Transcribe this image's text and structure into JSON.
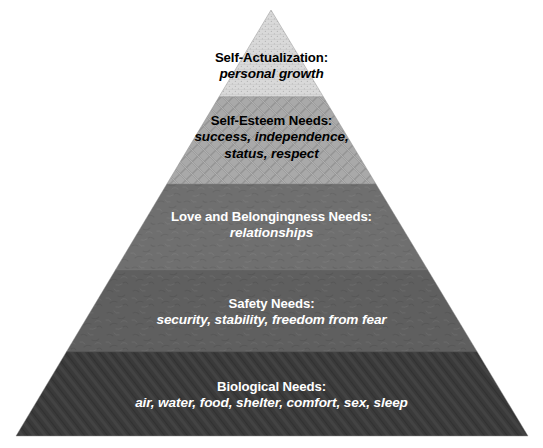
{
  "diagram": {
    "name": "Maslow's Hierarchy of Needs pyramid",
    "background_color": "#ffffff",
    "geometry": {
      "apex_x": 271,
      "apex_y": 10,
      "base_left_x": 16,
      "base_right_x": 528,
      "base_y": 436
    },
    "levels": [
      {
        "id": "self-actualization",
        "rank": 5,
        "title": "Self-Actualization:",
        "subtitle": "personal growth",
        "fill_color": "#d9d9d9",
        "text_color": "#000000",
        "texture": "fine-dotted-brick",
        "top_y": 10,
        "bottom_y": 97
      },
      {
        "id": "self-esteem",
        "rank": 4,
        "title": "Self-Esteem Needs:",
        "subtitle": "success, independence,\nstatus, respect",
        "subtitle_line_1": "success, independence,",
        "subtitle_line_2": "status, respect",
        "fill_color": "#a9a9a9",
        "text_color": "#000000",
        "texture": "diamond-lattice",
        "top_y": 97,
        "bottom_y": 184
      },
      {
        "id": "love-and-belongingness",
        "rank": 3,
        "title": "Love and Belongingness Needs:",
        "subtitle": "relationships",
        "fill_color": "#6f6f6f",
        "text_color": "#ffffff",
        "texture": "mottled-speckle",
        "top_y": 184,
        "bottom_y": 270
      },
      {
        "id": "safety",
        "rank": 2,
        "title": "Safety Needs:",
        "subtitle": "security, stability, freedom from fear",
        "fill_color": "#5f5f5f",
        "text_color": "#ffffff",
        "texture": "mottled-speckle",
        "top_y": 270,
        "bottom_y": 352
      },
      {
        "id": "biological",
        "rank": 1,
        "title": "Biological Needs:",
        "subtitle": "air, water, food, shelter, comfort, sex, sleep",
        "fill_color": "#3a3a3a",
        "text_color": "#ffffff",
        "texture": "diagonal-hatch",
        "top_y": 352,
        "bottom_y": 436
      }
    ]
  }
}
